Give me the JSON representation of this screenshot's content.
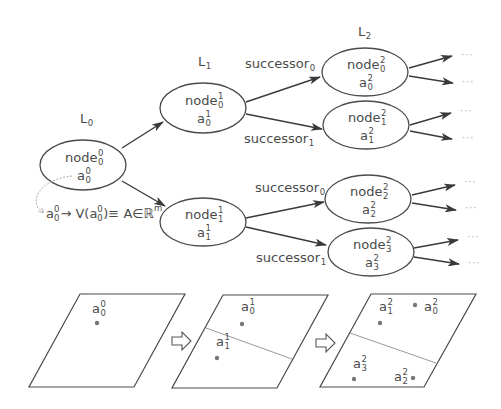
{
  "diagram": {
    "levels": [
      {
        "label": "L",
        "sub": "0",
        "x": 80,
        "y": 123
      },
      {
        "label": "L",
        "sub": "1",
        "x": 198,
        "y": 66
      },
      {
        "label": "L",
        "sub": "2",
        "x": 358,
        "y": 36
      }
    ],
    "nodes": [
      {
        "id": "n0_0",
        "name": "node",
        "sup": "0",
        "sub": "0",
        "a_sup": "0",
        "a_sub": "0",
        "cx": 83,
        "cy": 165,
        "rx": 43,
        "ry": 25
      },
      {
        "id": "n1_0",
        "name": "node",
        "sup": "1",
        "sub": "0",
        "a_sup": "1",
        "a_sub": "0",
        "cx": 203,
        "cy": 108,
        "rx": 43,
        "ry": 25
      },
      {
        "id": "n1_1",
        "name": "node",
        "sup": "1",
        "sub": "1",
        "a_sup": "1",
        "a_sub": "1",
        "cx": 203,
        "cy": 222,
        "rx": 43,
        "ry": 24
      },
      {
        "id": "n2_0",
        "name": "node",
        "sup": "2",
        "sub": "0",
        "a_sup": "2",
        "a_sub": "0",
        "cx": 365,
        "cy": 72,
        "rx": 43,
        "ry": 24
      },
      {
        "id": "n2_1",
        "name": "node",
        "sup": "2",
        "sub": "1",
        "a_sup": "2",
        "a_sub": "1",
        "cx": 366,
        "cy": 125,
        "rx": 43,
        "ry": 24
      },
      {
        "id": "n2_2",
        "name": "node",
        "sup": "2",
        "sub": "2",
        "a_sup": "2",
        "a_sub": "2",
        "cx": 368,
        "cy": 199,
        "rx": 43,
        "ry": 24
      },
      {
        "id": "n2_3",
        "name": "node",
        "sup": "2",
        "sub": "3",
        "a_sup": "2",
        "a_sub": "3",
        "cx": 371,
        "cy": 252,
        "rx": 43,
        "ry": 24
      }
    ],
    "edges": [
      {
        "from": "n0_0",
        "to": "n1_0",
        "x1": 122,
        "y1": 148,
        "x2": 163,
        "y2": 122
      },
      {
        "from": "n0_0",
        "to": "n1_1",
        "x1": 122,
        "y1": 181,
        "x2": 165,
        "y2": 206
      },
      {
        "from": "n1_0",
        "to": "n2_0",
        "x1": 246,
        "y1": 102,
        "x2": 320,
        "y2": 77
      },
      {
        "from": "n1_0",
        "to": "n2_1",
        "x1": 246,
        "y1": 114,
        "x2": 322,
        "y2": 129
      },
      {
        "from": "n1_1",
        "to": "n2_2",
        "x1": 246,
        "y1": 218,
        "x2": 324,
        "y2": 202
      },
      {
        "from": "n1_1",
        "to": "n2_3",
        "x1": 246,
        "y1": 227,
        "x2": 326,
        "y2": 245
      }
    ],
    "edge_labels": [
      {
        "text": "successor",
        "sub": "0",
        "x": 245,
        "y": 68
      },
      {
        "text": "successor",
        "sub": "1",
        "x": 244,
        "y": 143
      },
      {
        "text": "successor",
        "sub": "0",
        "x": 255,
        "y": 192
      },
      {
        "text": "successor",
        "sub": "1",
        "x": 256,
        "y": 262
      }
    ],
    "continuations": [
      {
        "x1": 409,
        "y1": 68,
        "x2": 452,
        "y2": 56,
        "dots_x": 461,
        "dots_y": 58
      },
      {
        "x1": 409,
        "y1": 76,
        "x2": 453,
        "y2": 83,
        "dots_x": 462,
        "dots_y": 85
      },
      {
        "x1": 410,
        "y1": 125,
        "x2": 451,
        "y2": 113,
        "dots_x": 460,
        "dots_y": 114
      },
      {
        "x1": 410,
        "y1": 131,
        "x2": 452,
        "y2": 139,
        "dots_x": 462,
        "dots_y": 141
      },
      {
        "x1": 412,
        "y1": 195,
        "x2": 455,
        "y2": 185,
        "dots_x": 464,
        "dots_y": 185
      },
      {
        "x1": 412,
        "y1": 203,
        "x2": 456,
        "y2": 210,
        "dots_x": 465,
        "dots_y": 211
      },
      {
        "x1": 414,
        "y1": 248,
        "x2": 458,
        "y2": 240,
        "dots_x": 467,
        "dots_y": 240
      },
      {
        "x1": 414,
        "y1": 257,
        "x2": 459,
        "y2": 264,
        "dots_x": 468,
        "dots_y": 266
      }
    ],
    "continuation_text": "···",
    "formula": {
      "parts": [
        "a",
        "0",
        "0",
        " → V(a",
        "0",
        "0",
        ")≡ A∈ℝ",
        "m"
      ],
      "x": 46,
      "y": 218
    },
    "panels": [
      {
        "points": "80,294 185,294 134,387 29,387",
        "divider": null,
        "points_list": [
          {
            "label": "a",
            "sup": "0",
            "sub": "0",
            "dot_x": 97,
            "dot_y": 323,
            "lx": 92,
            "ly": 313
          }
        ]
      },
      {
        "points": "223,295 328,295 277,388 172,388",
        "divider": {
          "x1": 206,
          "y1": 328,
          "x2": 292,
          "y2": 359
        },
        "points_list": [
          {
            "label": "a",
            "sup": "1",
            "sub": "0",
            "dot_x": 242,
            "dot_y": 324,
            "lx": 241,
            "ly": 311
          },
          {
            "label": "a",
            "sup": "1",
            "sub": "1",
            "dot_x": 217,
            "dot_y": 358,
            "lx": 216,
            "ly": 346
          }
        ]
      },
      {
        "points": "371,294 476,294 424,387 320,387",
        "divider": {
          "x1": 350,
          "y1": 333,
          "x2": 436,
          "y2": 363
        },
        "points_list": [
          {
            "label": "a",
            "sup": "2",
            "sub": "1",
            "dot_x": 380,
            "dot_y": 323,
            "lx": 379,
            "ly": 311
          },
          {
            "label": "a",
            "sup": "2",
            "sub": "0",
            "dot_x": 415,
            "dot_y": 305,
            "lx": 424,
            "ly": 311
          },
          {
            "label": "a",
            "sup": "2",
            "sub": "3",
            "dot_x": 354,
            "dot_y": 379,
            "lx": 353,
            "ly": 368
          },
          {
            "label": "a",
            "sup": "2",
            "sub": "2",
            "dot_x": 413,
            "dot_y": 378,
            "lx": 394,
            "ly": 381
          }
        ]
      }
    ],
    "transition_arrows": [
      {
        "x": 172,
        "y": 341
      },
      {
        "x": 316,
        "y": 343
      }
    ],
    "colors": {
      "stroke": "#4a4a4a",
      "text": "#4a4a4a",
      "divider": "#9a9a9a",
      "dot": "#777777",
      "background": "#ffffff"
    }
  }
}
